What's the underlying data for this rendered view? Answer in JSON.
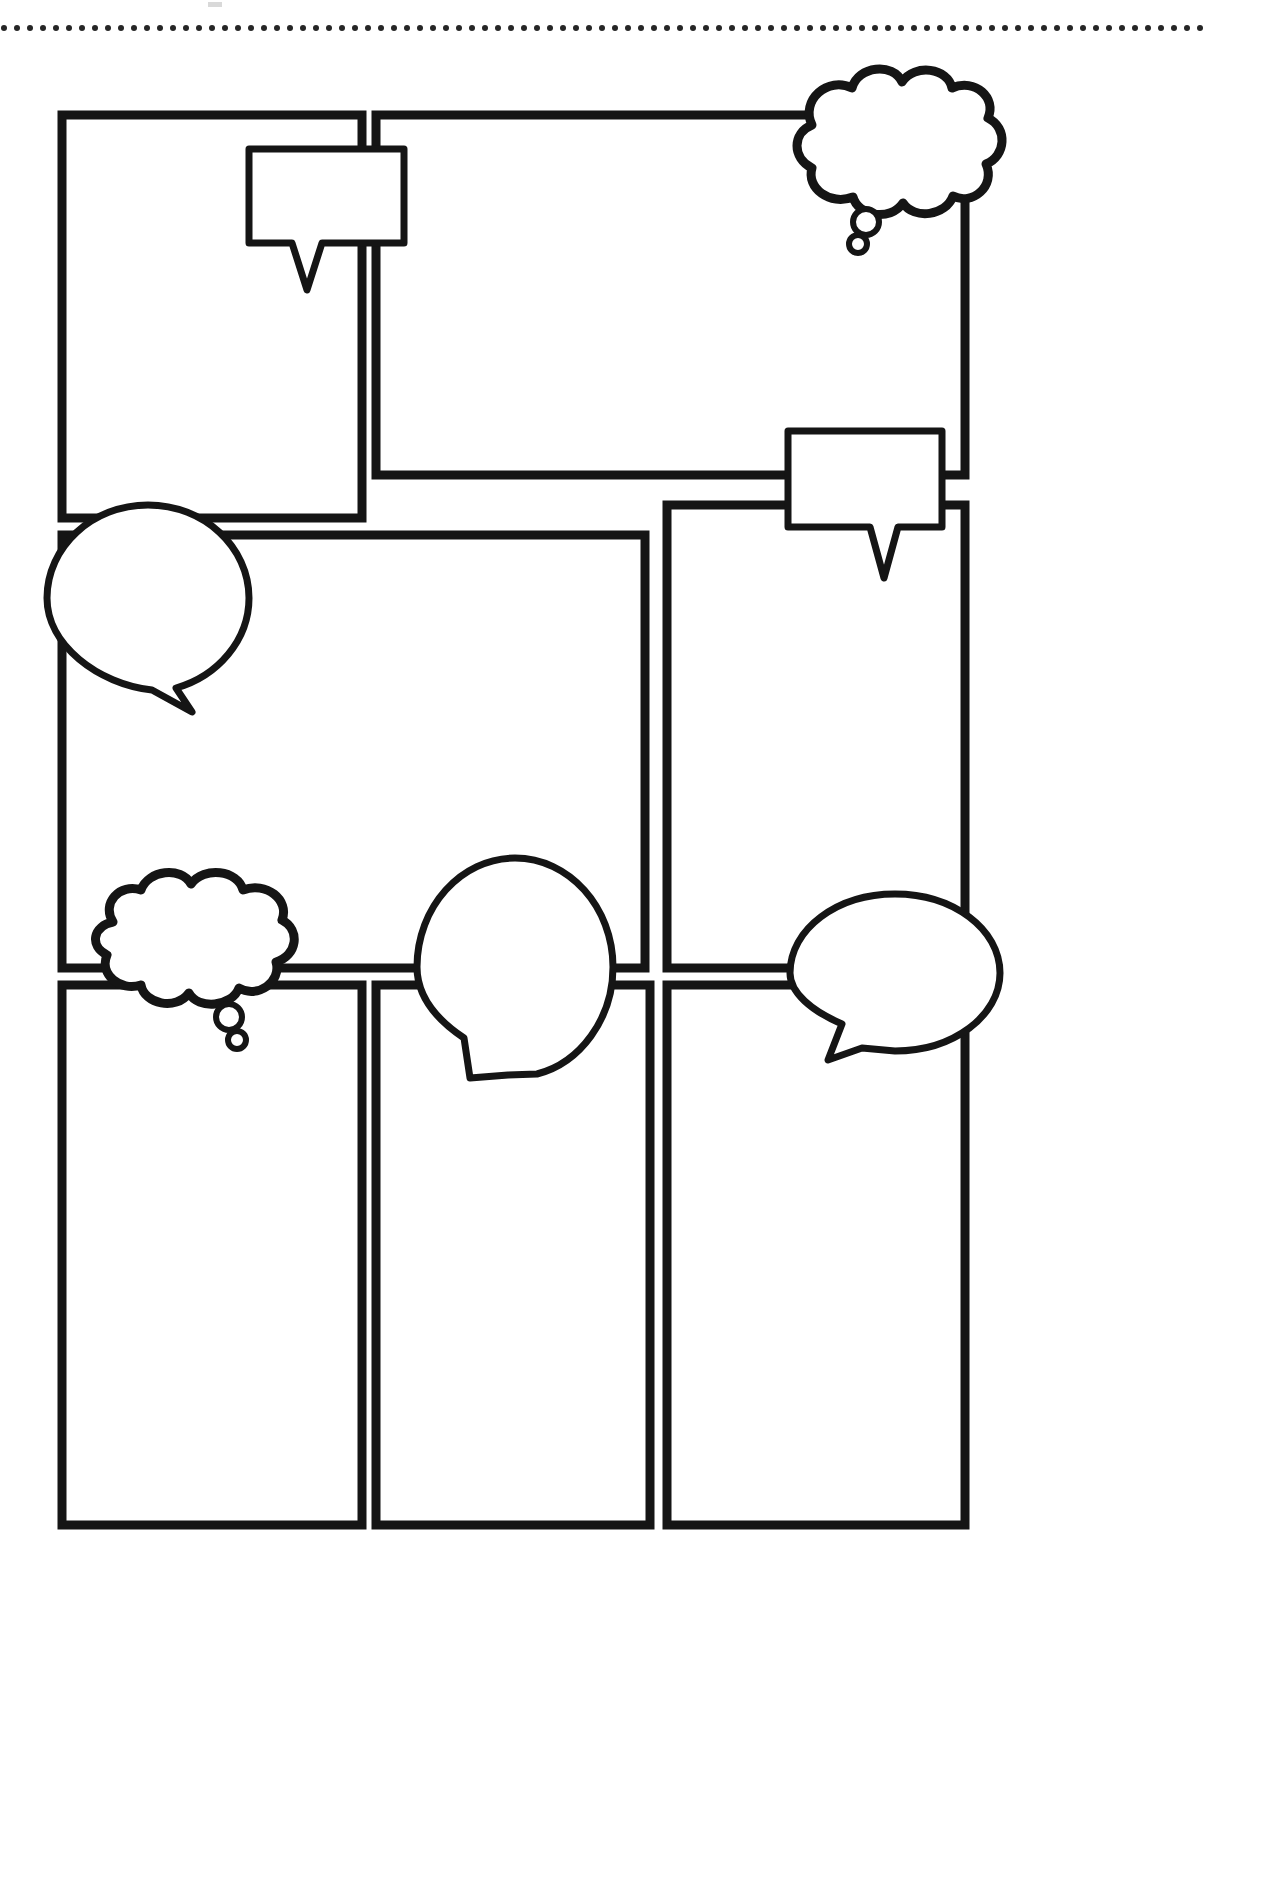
{
  "document": {
    "title": "Blank Comic Storyboard Template",
    "page_background": "#ffffff",
    "ink_color": "#151515",
    "width": 1270,
    "height": 1890
  },
  "top_rule": {
    "name": "dotted-divider",
    "style": "dotted",
    "dot_color": "#262626",
    "dot_radius": 3,
    "dot_spacing": 13,
    "y": 28,
    "x_start": 4,
    "x_end": 1206
  },
  "top_artifact": {
    "label": "",
    "x": 208,
    "y": 2,
    "width": 14,
    "height": 5,
    "color": "#d9d9d9"
  },
  "panels": [
    {
      "id": "panel-1",
      "name": "comic-panel-1",
      "row": 1,
      "x": 62,
      "y": 115,
      "width": 300,
      "height": 403,
      "content": ""
    },
    {
      "id": "panel-2",
      "name": "comic-panel-2",
      "row": 1,
      "x": 376,
      "y": 115,
      "width": 589,
      "height": 360,
      "content": ""
    },
    {
      "id": "panel-3",
      "name": "comic-panel-3",
      "row": 2,
      "x": 62,
      "y": 535,
      "width": 583,
      "height": 433,
      "content": ""
    },
    {
      "id": "panel-4",
      "name": "comic-panel-4",
      "row": 2,
      "x": 667,
      "y": 505,
      "width": 298,
      "height": 463,
      "content": ""
    },
    {
      "id": "panel-5",
      "name": "comic-panel-5",
      "row": 3,
      "x": 62,
      "y": 985,
      "width": 300,
      "height": 540,
      "content": ""
    },
    {
      "id": "panel-6",
      "name": "comic-panel-6",
      "row": 3,
      "x": 376,
      "y": 985,
      "width": 274,
      "height": 540,
      "content": ""
    },
    {
      "id": "panel-7",
      "name": "comic-panel-7",
      "row": 3,
      "x": 667,
      "y": 985,
      "width": 298,
      "height": 540,
      "content": ""
    }
  ],
  "bubbles": [
    {
      "id": "bubble-1",
      "name": "speech-bubble-rect-top-left",
      "kind": "rectangular-speech-bubble",
      "x": 248,
      "y": 148,
      "width": 157,
      "height": 95,
      "tail": "down-left-v",
      "text": ""
    },
    {
      "id": "bubble-2",
      "name": "thought-cloud-top-right",
      "kind": "thought-cloud",
      "cx": 897,
      "cy": 152,
      "rx": 102,
      "ry": 72,
      "trail_bubbles": 2,
      "text": ""
    },
    {
      "id": "bubble-3",
      "name": "speech-bubble-rect-middle-right",
      "kind": "rectangular-speech-bubble",
      "x": 787,
      "y": 430,
      "width": 156,
      "height": 97,
      "tail": "down-left-v",
      "text": ""
    },
    {
      "id": "bubble-4",
      "name": "speech-bubble-round-middle-left",
      "kind": "round-speech-bubble",
      "cx": 148,
      "cy": 598,
      "rx": 101,
      "ry": 93,
      "tail": "down-right",
      "text": ""
    },
    {
      "id": "bubble-5",
      "name": "thought-cloud-bottom-left",
      "kind": "thought-cloud",
      "cx": 194,
      "cy": 940,
      "rx": 100,
      "ry": 62,
      "trail_bubbles": 2,
      "text": ""
    },
    {
      "id": "bubble-6",
      "name": "speech-bubble-oval-bottom-center",
      "kind": "oval-speech-bubble",
      "cx": 515,
      "cy": 967,
      "rx": 98,
      "ry": 110,
      "tail": "down-left",
      "text": ""
    },
    {
      "id": "bubble-7",
      "name": "speech-bubble-oval-bottom-right",
      "kind": "oval-speech-bubble",
      "cx": 895,
      "cy": 973,
      "rx": 105,
      "ry": 79,
      "tail": "down-left",
      "text": ""
    }
  ],
  "legend": {
    "panel_count_label": "7",
    "bubble_count_label": "7"
  }
}
